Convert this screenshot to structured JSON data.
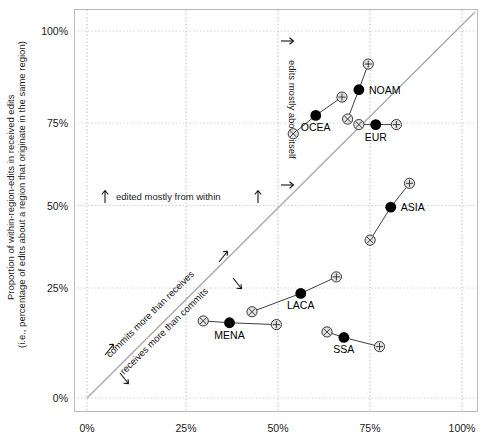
{
  "chart_data": {
    "type": "scatter",
    "title": "",
    "xlabel": "",
    "ylabel": "Proportion of within-region-edits in received edits (i.e., percentage of edits about a region that originate in the same region)",
    "ylabel_line1": "Proportion of within-region-edits in received edits",
    "ylabel_line2": "(i.e., percentage of edits about a region that originate in the same region)",
    "xlim": [
      0,
      100
    ],
    "ylim": [
      0,
      100
    ],
    "grid": true,
    "x_ticks": [
      "0%",
      "25%",
      "50%",
      "75%",
      "100%"
    ],
    "x_tick_values": [
      0,
      25,
      50,
      75,
      100
    ],
    "y_ticks": [
      "0%",
      "25%",
      "50%",
      "75%",
      "100%"
    ],
    "y_tick_values": [
      0,
      25,
      50,
      75,
      100
    ],
    "diagonal_line": {
      "from": [
        0,
        0
      ],
      "to": [
        100,
        100
      ]
    },
    "marker_legend": {
      "dot": "main value (filled circle)",
      "cross": "lower-bound estimate (circled x)",
      "plus": "upper-bound estimate (circled plus)"
    },
    "series": [
      {
        "name": "NOAM",
        "label_pos": "right",
        "dot": [
          72.5,
          84.0
        ],
        "cross": [
          69.5,
          76.0
        ],
        "plus": [
          75.0,
          91.0
        ]
      },
      {
        "name": "OCEA",
        "label_pos": "below",
        "dot": [
          61.0,
          77.0
        ],
        "cross": [
          55.0,
          72.0
        ],
        "plus": [
          68.0,
          82.0
        ]
      },
      {
        "name": "EUR",
        "label_pos": "below",
        "dot": [
          77.0,
          74.5
        ],
        "cross": [
          72.5,
          74.5
        ],
        "plus": [
          82.5,
          74.5
        ]
      },
      {
        "name": "ASIA",
        "label_pos": "right",
        "dot": [
          81.0,
          52.0
        ],
        "cross": [
          75.5,
          43.0
        ],
        "plus": [
          86.0,
          58.5
        ]
      },
      {
        "name": "LACA",
        "label_pos": "below",
        "dot": [
          57.0,
          28.5
        ],
        "cross": [
          44.0,
          23.5
        ],
        "plus": [
          66.5,
          33.0
        ]
      },
      {
        "name": "MENA",
        "label_pos": "below",
        "dot": [
          38.0,
          20.5
        ],
        "cross": [
          31.0,
          21.0
        ],
        "plus": [
          50.5,
          20.0
        ]
      },
      {
        "name": "SSA",
        "label_pos": "below",
        "dot": [
          68.5,
          16.5
        ],
        "cross": [
          64.0,
          18.0
        ],
        "plus": [
          78.0,
          14.0
        ]
      }
    ],
    "annotations": [
      {
        "id": "edited-from-within",
        "text": "edited mostly from within",
        "orientation": "horizontal",
        "at_y": 50
      },
      {
        "id": "edits-about-itself",
        "text": "edits mostly about itself",
        "orientation": "vertical",
        "at_x": 50
      },
      {
        "id": "commits-more",
        "text": "commits more than receives",
        "orientation": "diagonal"
      },
      {
        "id": "receives-more",
        "text": "receives more than commits",
        "orientation": "diagonal"
      }
    ]
  },
  "axis": {
    "y_title_line1": "Proportion of within-region-edits in received edits",
    "y_title_line2": "(i.e., percentage of edits about a region that originate in the same region)",
    "x_tick_0": "0%",
    "x_tick_25": "25%",
    "x_tick_50": "50%",
    "x_tick_75": "75%",
    "x_tick_100": "100%",
    "y_tick_0": "0%",
    "y_tick_25": "25%",
    "y_tick_50": "50%",
    "y_tick_75": "75%",
    "y_tick_100": "100%"
  },
  "labels": {
    "noam": "NOAM",
    "ocea": "OCEA",
    "eur": "EUR",
    "asia": "ASIA",
    "laca": "LACA",
    "mena": "MENA",
    "ssa": "SSA"
  },
  "annotations": {
    "edited_from_within": "edited mostly from within",
    "edits_about_itself": "edits mostly about itself",
    "commits_more": "commits more than receives",
    "receives_more": "receives more than commits"
  },
  "colors": {
    "background": "#ffffff",
    "frame": "#b9b9b9",
    "grid": "#cfcfcf",
    "diagonal": "#a8a8a8",
    "point_fill": "#000000",
    "marker_fill": "#e3e3e3",
    "marker_stroke": "#3a3a3a",
    "text": "#1a1a1a"
  }
}
